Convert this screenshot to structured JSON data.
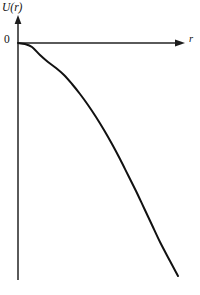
{
  "figure": {
    "background_color": "#ffffff",
    "width": 200,
    "height": 295,
    "y_axis_label": "U(r)",
    "x_axis_label": "r",
    "origin_label": "0",
    "caption_fragment": "",
    "axis_color": "#4a4a4a",
    "curve_color": "#111111"
  },
  "chart_data": {
    "type": "line",
    "title": "",
    "subtitle": "",
    "xlabel": "r",
    "ylabel": "U(r)",
    "legend": [],
    "legend_position": "none",
    "grid": false,
    "xlim": [
      0,
      1
    ],
    "ylim": [
      -1,
      0
    ],
    "axis_ticks": {
      "x": [],
      "y": [
        "0"
      ]
    },
    "annotations": [
      {
        "text": "0",
        "x": 0,
        "y": 0,
        "role": "origin-tick-label"
      },
      {
        "text": "r",
        "x": 1,
        "y": 0,
        "role": "x-axis-arrow-label"
      },
      {
        "text": "U(r)",
        "x": 0,
        "y": 0,
        "role": "y-axis-arrow-label"
      }
    ],
    "series": [
      {
        "name": "U(r)",
        "style": "solid",
        "linewidth": 2,
        "color": "#111111",
        "x": [
          0.0,
          0.05,
          0.1,
          0.15,
          0.2,
          0.25,
          0.3,
          0.35,
          0.4,
          0.45,
          0.5,
          0.55,
          0.6,
          0.65,
          0.7,
          0.75,
          0.8,
          0.85,
          0.9,
          0.95,
          1.0
        ],
        "y": [
          0.0,
          -0.008,
          -0.022,
          -0.042,
          -0.068,
          -0.1,
          -0.138,
          -0.182,
          -0.232,
          -0.288,
          -0.348,
          -0.412,
          -0.48,
          -0.551,
          -0.624,
          -0.699,
          -0.776,
          -0.854,
          -0.93,
          -0.98,
          -1.0
        ]
      }
    ],
    "pixel_path": {
      "origin_px": [
        18,
        43
      ],
      "points_px": [
        [
          18,
          43
        ],
        [
          25,
          44
        ],
        [
          32,
          47
        ],
        [
          40,
          55
        ],
        [
          48,
          62
        ],
        [
          56,
          68
        ],
        [
          64,
          75
        ],
        [
          72,
          84
        ],
        [
          80,
          94
        ],
        [
          88,
          105
        ],
        [
          96,
          117
        ],
        [
          104,
          130
        ],
        [
          112,
          144
        ],
        [
          120,
          159
        ],
        [
          128,
          175
        ],
        [
          136,
          191
        ],
        [
          144,
          208
        ],
        [
          152,
          225
        ],
        [
          160,
          242
        ],
        [
          170,
          261
        ],
        [
          178,
          276
        ]
      ],
      "x_axis_px": {
        "x1": 18,
        "y1": 43,
        "x2": 182,
        "y2": 43
      },
      "y_axis_px": {
        "x1": 18,
        "y1": 18,
        "x2": 18,
        "y2": 280
      }
    }
  }
}
